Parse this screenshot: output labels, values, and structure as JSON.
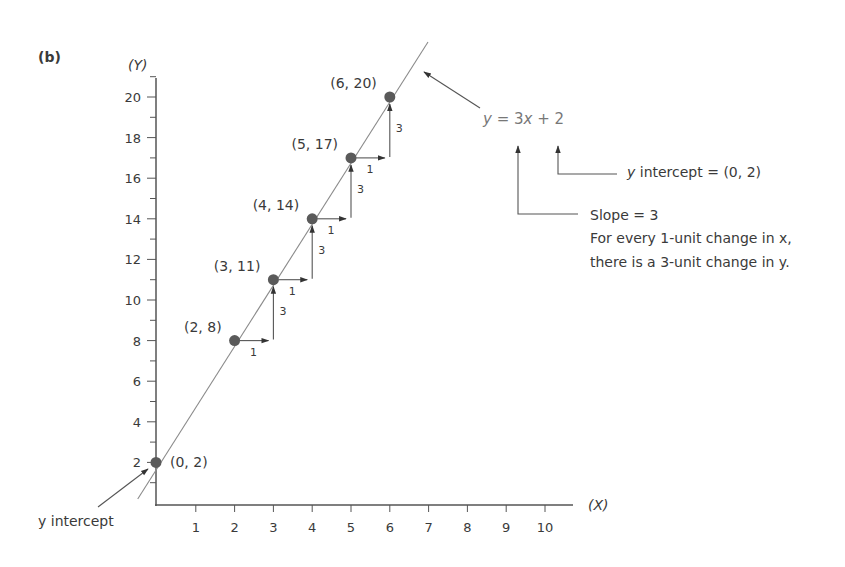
{
  "chart_data": {
    "type": "line",
    "panel_label": "(b)",
    "title": "",
    "xlabel": "(X)",
    "ylabel": "(Y)",
    "xlim": [
      0,
      10.7
    ],
    "ylim": [
      0,
      21
    ],
    "x_ticks": [
      1,
      2,
      3,
      4,
      5,
      6,
      7,
      8,
      9,
      10
    ],
    "y_ticks": [
      2,
      4,
      6,
      8,
      10,
      12,
      14,
      16,
      18,
      20
    ],
    "grid": false,
    "equation": "y = 3x + 2",
    "slope": 3,
    "intercept": 2,
    "line": {
      "x": [
        -0.6,
        7.0
      ],
      "y": [
        0.2,
        23.0
      ]
    },
    "points": [
      {
        "x": 0,
        "y": 2,
        "label": "(0, 2)"
      },
      {
        "x": 2,
        "y": 8,
        "label": "(2, 8)"
      },
      {
        "x": 3,
        "y": 11,
        "label": "(3, 11)"
      },
      {
        "x": 4,
        "y": 14,
        "label": "(4, 14)"
      },
      {
        "x": 5,
        "y": 17,
        "label": "(5, 17)"
      },
      {
        "x": 6,
        "y": 20,
        "label": "(6, 20)"
      }
    ],
    "steps": [
      {
        "from_x": 2,
        "run": 1,
        "rise": 3,
        "run_label": "1",
        "rise_label": "3"
      },
      {
        "from_x": 3,
        "run": 1,
        "rise": 3,
        "run_label": "1",
        "rise_label": "3"
      },
      {
        "from_x": 4,
        "run": 1,
        "rise": 3,
        "run_label": "1",
        "rise_label": "3"
      },
      {
        "from_x": 5,
        "run": 1,
        "rise": 3,
        "run_label": "1",
        "rise_label": "3"
      }
    ],
    "annotations": {
      "y_intercept_left": "y intercept",
      "y_intercept_note": "y intercept = (0, 2)",
      "slope_note": "Slope = 3",
      "slope_line1": "For every 1-unit change in x,",
      "slope_line2": "there is a 3-unit change in y."
    }
  },
  "colors": {
    "axis": "#555555",
    "line": "#8a8a8a",
    "point": "#5a5a5a",
    "text": "#3a3a3a",
    "equation": "#777777"
  }
}
